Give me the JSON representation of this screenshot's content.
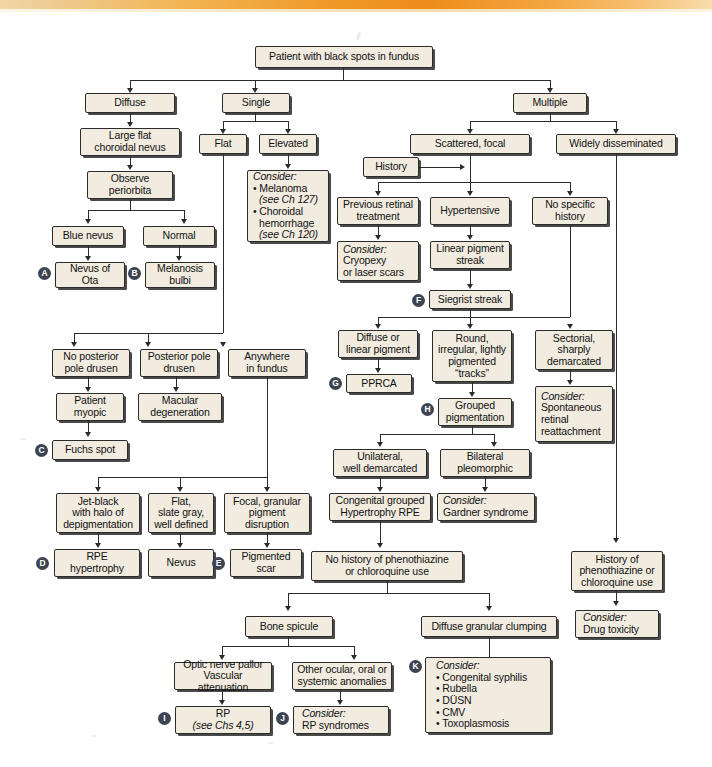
{
  "figure": {
    "title": "Patient with black spots in fundus",
    "type": "clinical-decision-flowchart",
    "accent_band_color": "#ee8c1c",
    "box_fill_color": "#f2ece0",
    "box_border_color": "#2b2b2b",
    "marker_color": "#3c4452"
  },
  "nodes": {
    "root": "Patient with black spots in fundus",
    "diffuse": "Diffuse",
    "single": "Single",
    "multiple": "Multiple",
    "large_flat_choroidal_nevus": [
      "Large flat",
      "choroidal nevus"
    ],
    "observe_periorbita": [
      "Observe",
      "periorbita"
    ],
    "blue_nevus": "Blue nevus",
    "normal": "Normal",
    "nevus_of_ota": [
      "Nevus of",
      "Ota"
    ],
    "melanosis_bulbi": [
      "Melanosis",
      "bulbi"
    ],
    "flat": "Flat",
    "elevated": "Elevated",
    "consider_melanoma": {
      "lead": "Consider:",
      "items": [
        "Melanoma",
        "(see Ch 127)",
        "Choroidal",
        "hemorrhage",
        "(see Ch 120)"
      ],
      "bullets": [
        {
          "text": "Melanoma",
          "cont": "(see Ch 127)"
        },
        {
          "text": "Choroidal",
          "cont": "hemorrhage",
          "cont2": "(see Ch 120)"
        }
      ]
    },
    "scattered_focal": "Scattered, focal",
    "widely_disseminated": "Widely disseminated",
    "history": "History",
    "previous_retinal_treatment": [
      "Previous retinal",
      "treatment"
    ],
    "hypertensive": "Hypertensive",
    "no_specific_history": [
      "No specific",
      "history"
    ],
    "consider_cryopexy": {
      "lead": "Consider:",
      "lines": [
        "Cryopexy",
        "or laser scars"
      ]
    },
    "linear_pigment_streak": [
      "Linear pigment",
      "streak"
    ],
    "siegrist_streak": "Siegrist streak",
    "diffuse_or_linear_pigment": [
      "Diffuse or",
      "linear pigment"
    ],
    "round_irregular": [
      "Round,",
      "irregular, lightly",
      "pigmented",
      "“tracks”"
    ],
    "sectorial_sharply_demarcated": [
      "Sectorial,",
      "sharply",
      "demarcated"
    ],
    "pprca": "PPRCA",
    "grouped_pigmentation": [
      "Grouped",
      "pigmentation"
    ],
    "consider_spontaneous": {
      "lead": "Consider:",
      "lines": [
        "Spontaneous",
        "retinal",
        "reattachment"
      ]
    },
    "unilateral_well_demarcated": [
      "Unilateral,",
      "well demarcated"
    ],
    "bilateral_pleomorphic": [
      "Bilateral",
      "pleomorphic"
    ],
    "congenital_grouped_hypertrophy": [
      "Congenital grouped",
      "Hypertrophy RPE"
    ],
    "consider_gardner": {
      "lead": "Consider:",
      "lines": [
        "Gardner syndrome"
      ]
    },
    "no_posterior_pole_drusen": [
      "No posterior",
      "pole drusen"
    ],
    "posterior_pole_drusen": [
      "Posterior pole",
      "drusen"
    ],
    "anywhere_in_fundus": [
      "Anywhere",
      "in fundus"
    ],
    "patient_myopic": [
      "Patient",
      "myopic"
    ],
    "macular_degeneration": [
      "Macular",
      "degeneration"
    ],
    "fuchs_spot": "Fuchs spot",
    "jet_black": [
      "Jet-black",
      "with halo of",
      "depigmentation"
    ],
    "flat_slate_gray": [
      "Flat,",
      "slate gray,",
      "well defined"
    ],
    "focal_granular": [
      "Focal, granular",
      "pigment",
      "disruption"
    ],
    "rpe_hypertrophy": [
      "RPE",
      "hypertrophy"
    ],
    "nevus": "Nevus",
    "pigmented_scar": [
      "Pigmented",
      "scar"
    ],
    "no_history_phenothiazine": [
      "No history of phenothiazine",
      "or chloroquine use"
    ],
    "history_phenothiazine": [
      "History of",
      "phenothiazine or",
      "chloroquine use"
    ],
    "consider_drug_toxicity": {
      "lead": "Consider:",
      "lines": [
        "Drug toxicity"
      ]
    },
    "bone_spicule": "Bone spicule",
    "diffuse_granular_clumping": "Diffuse granular clumping",
    "optic_nerve_pallor": [
      "Optic nerve pallor",
      "Vascular attenuation"
    ],
    "other_ocular": [
      "Other ocular, oral or",
      "systemic anomalies"
    ],
    "rp": {
      "line1": "RP",
      "line2": "(see Chs 4,5)"
    },
    "consider_rp_syndromes": {
      "lead": "Consider:",
      "lines": [
        "RP syndromes"
      ]
    },
    "consider_congenital": {
      "lead": "Consider:",
      "lines": [
        "Congenital syphilis",
        "Rubella",
        "DÜSN",
        "CMV",
        "Toxoplasmosis"
      ]
    }
  },
  "markers": {
    "a": "A",
    "b": "B",
    "c": "C",
    "d": "D",
    "e": "E",
    "f": "F",
    "g": "G",
    "h": "H",
    "i": "I",
    "j": "J",
    "k": "K"
  }
}
